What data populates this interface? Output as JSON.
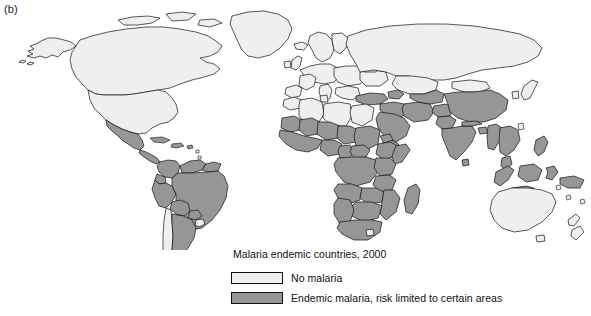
{
  "panel": {
    "label": "(b)"
  },
  "legend": {
    "title": "Malaria endemic countries, 2000",
    "entries": [
      {
        "swatch": "no-malaria-swatch",
        "color": "#efefef",
        "label": "No malaria"
      },
      {
        "swatch": "endemic-malaria-swatch",
        "color": "#969696",
        "label": "Endemic malaria, risk limited to certain areas"
      }
    ]
  },
  "map": {
    "type": "choropleth-world-map",
    "background": "#ffffff",
    "outline_color": "#111111",
    "categories": [
      {
        "key": "none",
        "color": "#efefef",
        "label": "No malaria"
      },
      {
        "key": "endemic",
        "color": "#969696",
        "label": "Endemic malaria, risk limited to certain areas"
      }
    ],
    "regions_no_malaria": [
      "Canada",
      "United States",
      "Greenland",
      "Iceland",
      "United Kingdom",
      "Ireland",
      "Norway",
      "Sweden",
      "Finland",
      "Denmark",
      "Germany",
      "France",
      "Spain",
      "Portugal",
      "Italy",
      "Poland",
      "Austria",
      "Switzerland",
      "Belarus",
      "Ukraine",
      "Baltic States",
      "Balkans",
      "Greece",
      "Chile",
      "Uruguay",
      "Libya",
      "Egypt",
      "Tunisia",
      "Morocco",
      "Algeria",
      "Lesotho",
      "Australia",
      "New Zealand",
      "Japan",
      "Mongolia",
      "Kazakhstan",
      "Russia"
    ],
    "regions_endemic": [
      "Mexico",
      "Guatemala",
      "Belize",
      "Honduras",
      "El Salvador",
      "Nicaragua",
      "Costa Rica",
      "Panama",
      "Cuba",
      "Haiti",
      "Dominican Republic",
      "Colombia",
      "Venezuela",
      "Guyana",
      "Suriname",
      "French Guiana",
      "Ecuador",
      "Peru",
      "Bolivia",
      "Brazil",
      "Paraguay",
      "Argentina",
      "Mauritania",
      "Mali",
      "Niger",
      "Chad",
      "Sudan",
      "Eritrea",
      "Ethiopia",
      "Somalia",
      "Senegal",
      "Gambia",
      "Guinea",
      "Sierra Leone",
      "Liberia",
      "Ivory Coast",
      "Ghana",
      "Togo",
      "Benin",
      "Nigeria",
      "Cameroon",
      "Central African Republic",
      "Gabon",
      "Congo",
      "DR Congo",
      "Angola",
      "Zambia",
      "Zimbabwe",
      "Mozambique",
      "Malawi",
      "Tanzania",
      "Kenya",
      "Uganda",
      "Rwanda",
      "Burundi",
      "Namibia",
      "Botswana",
      "South Africa",
      "Madagascar",
      "Turkey",
      "Syria",
      "Iraq",
      "Iran",
      "Saudi Arabia",
      "Yemen",
      "Oman",
      "Afghanistan",
      "Pakistan",
      "India",
      "Nepal",
      "Bhutan",
      "Bangladesh",
      "Sri Lanka",
      "Myanmar",
      "Thailand",
      "Laos",
      "Cambodia",
      "Vietnam",
      "Malaysia",
      "Indonesia",
      "Philippines",
      "Papua New Guinea",
      "China",
      "Turkmenistan",
      "Uzbekistan",
      "Tajikistan",
      "Azerbaijan"
    ]
  }
}
